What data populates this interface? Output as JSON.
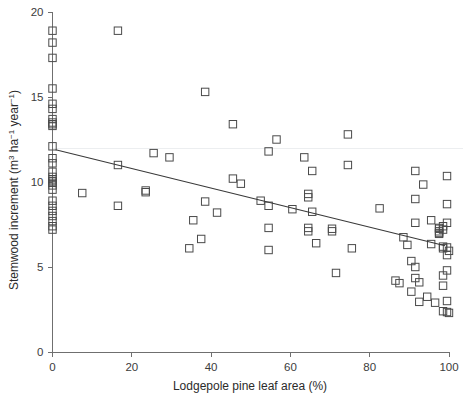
{
  "chart_data": {
    "type": "scatter",
    "title": "",
    "xlabel": "Lodgepole pine leaf area (%)",
    "ylabel": "Stemwood increment (m³ ha⁻¹ year⁻¹)",
    "ylabel_parts": {
      "prefix": "Stemwood increment (m",
      "sup1": "3",
      "mid": " ha",
      "sup2": "−1",
      "mid2": " year",
      "sup3": "−1",
      "suffix": ")"
    },
    "xlim": [
      0,
      100
    ],
    "ylim": [
      0,
      20
    ],
    "xticks": [
      0,
      20,
      40,
      60,
      80,
      100
    ],
    "yticks": [
      0,
      5,
      10,
      15,
      20
    ],
    "xticklabels": [
      "0",
      "20",
      "40",
      "60",
      "80",
      "100"
    ],
    "yticklabels": [
      "0",
      "5",
      "10",
      "15",
      "20"
    ],
    "grid": "single faint horizontal gridline near y = 11.95",
    "gridlines_y": [
      11.95
    ],
    "legend": "none",
    "marker_style": "open square",
    "marker_color": "#4a4a4a",
    "series": [
      {
        "name": "Stand plots",
        "points": [
          [
            0,
            18.9
          ],
          [
            0,
            18.2
          ],
          [
            0,
            17.3
          ],
          [
            0,
            15.5
          ],
          [
            0,
            14.6
          ],
          [
            0,
            14.3
          ],
          [
            0,
            13.7
          ],
          [
            0,
            13.5
          ],
          [
            0,
            13.4
          ],
          [
            0,
            13.3
          ],
          [
            0,
            12.1
          ],
          [
            0,
            11.4
          ],
          [
            0,
            11.1
          ],
          [
            0,
            10.6
          ],
          [
            0,
            10.3
          ],
          [
            0,
            10.15
          ],
          [
            0,
            10.05
          ],
          [
            0,
            9.95
          ],
          [
            0,
            9.8
          ],
          [
            0,
            9.55
          ],
          [
            0,
            8.9
          ],
          [
            0,
            8.6
          ],
          [
            0,
            8.3
          ],
          [
            0,
            8.0
          ],
          [
            0,
            7.7
          ],
          [
            0,
            7.4
          ],
          [
            0,
            7.2
          ],
          [
            7.5,
            9.35
          ],
          [
            16.5,
            18.9
          ],
          [
            16.5,
            11.0
          ],
          [
            16.5,
            8.6
          ],
          [
            23.5,
            9.5
          ],
          [
            23.5,
            9.4
          ],
          [
            25.5,
            11.7
          ],
          [
            29.5,
            11.45
          ],
          [
            34.5,
            6.1
          ],
          [
            35.5,
            7.75
          ],
          [
            37.5,
            6.65
          ],
          [
            38.5,
            15.3
          ],
          [
            38.5,
            8.85
          ],
          [
            41.5,
            8.2
          ],
          [
            45.5,
            13.4
          ],
          [
            45.5,
            10.2
          ],
          [
            47.5,
            9.9
          ],
          [
            52.5,
            8.9
          ],
          [
            54.5,
            11.8
          ],
          [
            54.5,
            8.6
          ],
          [
            54.5,
            7.3
          ],
          [
            54.5,
            6.0
          ],
          [
            56.5,
            12.5
          ],
          [
            60.5,
            8.4
          ],
          [
            63.5,
            11.45
          ],
          [
            64.5,
            9.3
          ],
          [
            64.5,
            9.1
          ],
          [
            64.5,
            7.3
          ],
          [
            64.5,
            7.1
          ],
          [
            65.5,
            10.65
          ],
          [
            65.5,
            8.25
          ],
          [
            66.5,
            6.4
          ],
          [
            70.5,
            7.25
          ],
          [
            70.5,
            7.1
          ],
          [
            71.5,
            4.65
          ],
          [
            74.5,
            12.8
          ],
          [
            74.5,
            11.0
          ],
          [
            75.5,
            6.1
          ],
          [
            82.5,
            8.45
          ],
          [
            86.5,
            4.2
          ],
          [
            87.5,
            4.05
          ],
          [
            88.5,
            6.75
          ],
          [
            89.5,
            6.3
          ],
          [
            90.5,
            5.35
          ],
          [
            90.5,
            3.55
          ],
          [
            91.5,
            10.65
          ],
          [
            91.5,
            9.0
          ],
          [
            91.5,
            7.6
          ],
          [
            91.5,
            5.0
          ],
          [
            91.5,
            4.35
          ],
          [
            92.5,
            4.1
          ],
          [
            92.5,
            2.95
          ],
          [
            93.5,
            9.85
          ],
          [
            94.5,
            3.25
          ],
          [
            95.5,
            7.75
          ],
          [
            95.5,
            6.35
          ],
          [
            96.5,
            2.9
          ],
          [
            97.5,
            7.3
          ],
          [
            97.5,
            7.25
          ],
          [
            97.5,
            7.1
          ],
          [
            97.5,
            7.0
          ],
          [
            97.5,
            6.95
          ],
          [
            98.5,
            7.4
          ],
          [
            98.5,
            7.2
          ],
          [
            98.5,
            6.2
          ],
          [
            98.5,
            6.1
          ],
          [
            98.5,
            4.5
          ],
          [
            98.5,
            3.9
          ],
          [
            98.5,
            2.4
          ],
          [
            99.5,
            10.35
          ],
          [
            99.5,
            8.7
          ],
          [
            99.5,
            7.6
          ],
          [
            99.5,
            6.15
          ],
          [
            99.5,
            5.7
          ],
          [
            99.5,
            4.8
          ],
          [
            99.5,
            3.0
          ],
          [
            99.5,
            2.35
          ],
          [
            100,
            5.95
          ],
          [
            100,
            2.3
          ]
        ]
      }
    ],
    "fit_line": {
      "name": "linear regression",
      "x": [
        0.8,
        99.0
      ],
      "y": [
        11.9,
        6.25
      ],
      "color": "#3a3a3a"
    }
  }
}
